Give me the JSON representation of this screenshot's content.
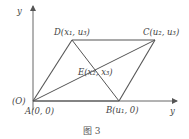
{
  "figure": {
    "caption": "图 3",
    "axes": {
      "y_label": "y",
      "x_label": "y",
      "origin_label": "(O)"
    },
    "points": {
      "A": "A(0, 0)",
      "B": "B(u₁, 0)",
      "C": "C(u₂, u₃)",
      "D": "D(x₁, u₃)",
      "E": "E(x₂, x₃)"
    },
    "colors": {
      "line": "#555555",
      "text": "#444444"
    }
  }
}
